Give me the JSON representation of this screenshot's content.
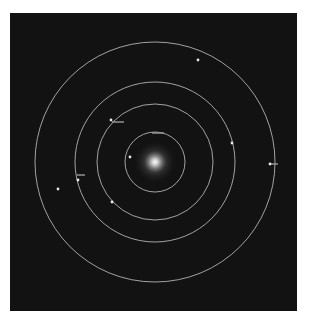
{
  "diagram": {
    "type": "orbital-system",
    "background": "#121212",
    "center": {
      "x": 155,
      "y": 162
    },
    "star": {
      "name": "central-star",
      "color": "#ffffff",
      "glow_radius": 22
    },
    "orbit_color": "#cfcfcf",
    "orbits": [
      {
        "radius": 30
      },
      {
        "radius": 58
      },
      {
        "radius": 80
      },
      {
        "radius": 120
      }
    ],
    "bodies": [
      {
        "orbit": 1,
        "x": 130,
        "y": 157,
        "label": ""
      },
      {
        "orbit": 2,
        "x": 112,
        "y": 202,
        "label": ""
      },
      {
        "orbit": 2,
        "x": 111,
        "y": 120,
        "label": ""
      },
      {
        "orbit": 3,
        "x": 78,
        "y": 180,
        "label": ""
      },
      {
        "orbit": 3,
        "x": 232,
        "y": 143,
        "label": ""
      },
      {
        "orbit": 4,
        "x": 198,
        "y": 60,
        "label": ""
      },
      {
        "orbit": 4,
        "x": 270,
        "y": 164,
        "label": ""
      },
      {
        "orbit": 0,
        "x": 58,
        "y": 189,
        "label": ""
      }
    ],
    "label_markers": [
      {
        "x": 112,
        "y": 121,
        "w": 12
      },
      {
        "x": 152,
        "y": 132,
        "w": 12
      },
      {
        "x": 270,
        "y": 163,
        "w": 8
      },
      {
        "x": 77,
        "y": 174,
        "w": 8
      }
    ]
  }
}
